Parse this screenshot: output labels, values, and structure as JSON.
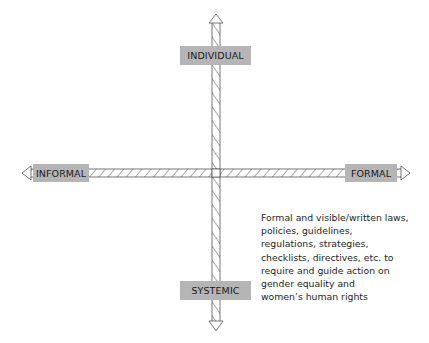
{
  "diagram": {
    "type": "quadrant-axes",
    "axes": {
      "vertical": {
        "top_label": "INDIVIDUAL",
        "bottom_label": "SYSTEMIC"
      },
      "horizontal": {
        "left_label": "INFORMAL",
        "right_label": "FORMAL"
      }
    },
    "description": "Formal and visible/written laws,\npolicies, guidelines,\nregulations, strategies,\nchecklists, directives, etc. to\nrequire and guide action on\ngender equality and\nwomen’s human rights",
    "colors": {
      "label_box": "#b5b5b5",
      "axis_stroke": "#555555",
      "text": "#1e1e1e"
    }
  }
}
